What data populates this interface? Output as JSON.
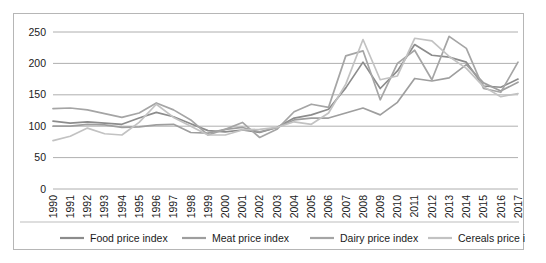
{
  "chart_data": {
    "type": "line",
    "title": "",
    "xlabel": "",
    "ylabel": "",
    "grid": true,
    "legend_position": "bottom",
    "ylim": [
      0,
      250
    ],
    "yticks": [
      0,
      50,
      100,
      150,
      200,
      250
    ],
    "ytick_labels": [
      "0",
      "50",
      "100",
      "150",
      "200",
      "250"
    ],
    "categories": [
      "1990",
      "1991",
      "1992",
      "1993",
      "1994",
      "1995",
      "1996",
      "1997",
      "1998",
      "1999",
      "2000",
      "2001",
      "2002",
      "2003",
      "2004",
      "2005",
      "2006",
      "2007",
      "2008",
      "2009",
      "2010",
      "2011",
      "2012",
      "2013",
      "2014",
      "2015",
      "2016",
      "2017"
    ],
    "series": [
      {
        "name": "Food price index",
        "color": "#8c8c8c",
        "values": [
          108,
          105,
          107,
          105,
          103,
          113,
          122,
          115,
          104,
          93,
          91,
          94,
          90,
          98,
          113,
          118,
          127,
          161,
          202,
          160,
          188,
          230,
          213,
          210,
          202,
          164,
          162,
          175
        ]
      },
      {
        "name": "Meat price index",
        "color": "#9e9e9e",
        "values": [
          100,
          100,
          103,
          102,
          98,
          99,
          102,
          103,
          90,
          89,
          95,
          98,
          91,
          98,
          110,
          113,
          113,
          121,
          129,
          118,
          138,
          176,
          172,
          177,
          198,
          169,
          156,
          170
        ]
      },
      {
        "name": "Dairy price index",
        "color": "#a5a5a5",
        "values": [
          128,
          129,
          126,
          120,
          114,
          121,
          137,
          126,
          110,
          86,
          95,
          106,
          82,
          95,
          123,
          135,
          130,
          212,
          220,
          142,
          200,
          221,
          174,
          243,
          224,
          160,
          154,
          202
        ]
      },
      {
        "name": "Cereals price index",
        "color": "#c2c2c2",
        "values": [
          77,
          84,
          97,
          88,
          86,
          106,
          135,
          114,
          100,
          86,
          86,
          94,
          95,
          98,
          107,
          103,
          121,
          167,
          238,
          174,
          180,
          240,
          236,
          211,
          192,
          163,
          147,
          152
        ]
      }
    ],
    "legend": [
      {
        "label": "Food price index",
        "color": "#8c8c8c"
      },
      {
        "label": "Meat price index",
        "color": "#9e9e9e"
      },
      {
        "label": "Dairy price index",
        "color": "#a5a5a5"
      },
      {
        "label": "Cereals price index",
        "color": "#c2c2c2"
      }
    ]
  }
}
